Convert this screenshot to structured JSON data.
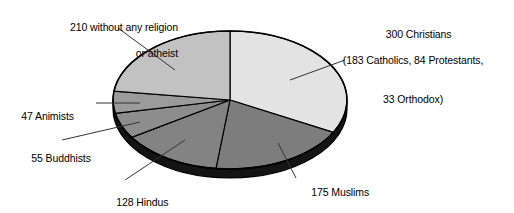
{
  "chart_data": {
    "type": "pie",
    "title": "",
    "subtitle": "",
    "xlabel": "",
    "ylabel": "",
    "legend_position": "callout-labels",
    "grid": false,
    "total": 915,
    "start_angle_deg": 0,
    "direction": "clockwise",
    "style": "3d-ellipse",
    "categories": [
      "300 Christians",
      "175 Muslims",
      "128 Hindus",
      "55 Buddhists",
      "47 Animists",
      "210 without any religion or atheist"
    ],
    "values": [
      300,
      175,
      128,
      55,
      47,
      210
    ],
    "slices": [
      {
        "name": "christians",
        "value": 300,
        "angle_deg": 118.0,
        "color": "#e3e3e3",
        "side_color": "#1b1b1b",
        "label_lines": [
          "300 Christians",
          "(183 Catholics, 84 Protestants,",
          "33 Orthodox)"
        ],
        "breakdown": [
          {
            "name": "Catholics",
            "value": 183
          },
          {
            "name": "Protestants",
            "value": 84
          },
          {
            "name": "Orthodox",
            "value": 33
          }
        ]
      },
      {
        "name": "muslims",
        "value": 175,
        "angle_deg": 68.9,
        "color": "#7d7d7d",
        "side_color": "#151515",
        "label_lines": [
          "175 Muslims"
        ]
      },
      {
        "name": "hindus",
        "value": 128,
        "angle_deg": 50.4,
        "color": "#838383",
        "side_color": "#151515",
        "label_lines": [
          "128 Hindus"
        ]
      },
      {
        "name": "buddhists",
        "value": 55,
        "angle_deg": 21.6,
        "color": "#8d8d8d",
        "side_color": "#151515",
        "label_lines": [
          "55 Buddhists"
        ]
      },
      {
        "name": "animists",
        "value": 47,
        "angle_deg": 18.5,
        "color": "#9b9b9b",
        "side_color": "#151515",
        "label_lines": [
          "47 Animists"
        ]
      },
      {
        "name": "no-religion",
        "value": 210,
        "angle_deg": 82.6,
        "color": "#c2c2c2",
        "side_color": "#1b1b1b",
        "label_lines": [
          "210 without any religion",
          "or atheist"
        ]
      }
    ]
  },
  "labels": {
    "no_religion": {
      "line1": "210 without any religion",
      "line2": "or atheist"
    },
    "christians": {
      "line1": "300 Christians",
      "line2": "(183 Catholics, 84 Protestants,",
      "line3": "33 Orthodox)"
    },
    "animists": {
      "line1": "47 Animists"
    },
    "buddhists": {
      "line1": "55 Buddhists"
    },
    "hindus": {
      "line1": "128 Hindus"
    },
    "muslims": {
      "line1": "175 Muslims"
    }
  },
  "colors": {
    "background": "#ffffff",
    "outline": "#000000",
    "text": "#000000",
    "leader_line": "#333333"
  }
}
